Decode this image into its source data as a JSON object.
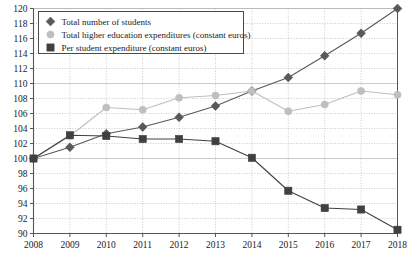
{
  "chart_data": {
    "type": "line",
    "title": "",
    "xlabel": "",
    "ylabel": "",
    "x": [
      2008,
      2009,
      2010,
      2011,
      2012,
      2013,
      2014,
      2015,
      2016,
      2017,
      2018
    ],
    "categories": [
      "2008",
      "2009",
      "2010",
      "2011",
      "2012",
      "2013",
      "2014",
      "2015",
      "2016",
      "2017",
      "2018"
    ],
    "xlim": [
      2008,
      2018
    ],
    "ylim": [
      90,
      120
    ],
    "ytick_labels": [
      "90",
      "92",
      "94",
      "96",
      "98",
      "100",
      "102",
      "104",
      "106",
      "108",
      "110",
      "112",
      "114",
      "116",
      "118",
      "120"
    ],
    "ytick_values": [
      90,
      92,
      94,
      96,
      98,
      100,
      102,
      104,
      106,
      108,
      110,
      112,
      114,
      116,
      118,
      120
    ],
    "grid": true,
    "legend_position": "top-left",
    "series": [
      {
        "name": "Total number of students",
        "marker": "diamond",
        "color": "#595959",
        "values": [
          100.0,
          101.5,
          103.3,
          104.2,
          105.5,
          107.0,
          109.0,
          110.8,
          113.7,
          116.7,
          120.0
        ]
      },
      {
        "name": "Total higher education expenditures (constant euros)",
        "marker": "circle",
        "color": "#bfbfbf",
        "values": [
          100.0,
          103.0,
          106.8,
          106.5,
          108.1,
          108.4,
          109.0,
          106.3,
          107.2,
          109.0,
          108.5
        ]
      },
      {
        "name": "Per student expenditure (constant euros)",
        "marker": "square",
        "color": "#404040",
        "values": [
          100.0,
          103.1,
          103.0,
          102.6,
          102.6,
          102.3,
          100.1,
          95.7,
          93.4,
          93.2,
          90.5
        ]
      }
    ]
  },
  "legend": {
    "items": [
      {
        "label": "Total number of students",
        "marker": "diamond-marker",
        "color": "#595959"
      },
      {
        "label": "Total higher education expenditures (constant euros)",
        "marker": "circle-marker",
        "color": "#bfbfbf"
      },
      {
        "label": "Per student expenditure (constant euros)",
        "marker": "square-marker",
        "color": "#404040"
      }
    ]
  },
  "axes": {
    "y_labels": [
      "120",
      "118",
      "116",
      "114",
      "112",
      "110",
      "108",
      "106",
      "104",
      "102",
      "100",
      "98",
      "96",
      "94",
      "92",
      "90"
    ],
    "x_labels": [
      "2008",
      "2009",
      "2010",
      "2011",
      "2012",
      "2013",
      "2014",
      "2015",
      "2016",
      "2017",
      "2018"
    ]
  },
  "style": {
    "grid_color": "#b5b5b5",
    "axis_color": "#555555",
    "background": "#ffffff"
  }
}
